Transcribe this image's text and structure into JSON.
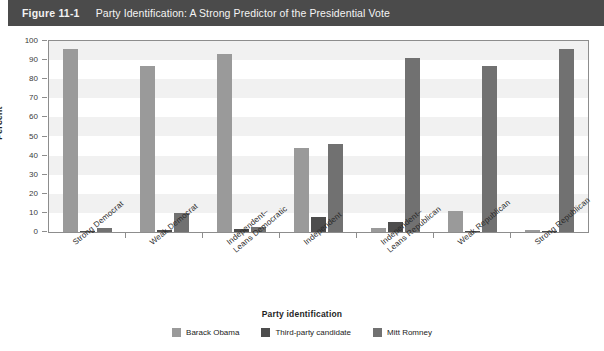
{
  "figure": {
    "number": "Figure 11-1",
    "title": "Party Identification: A Strong Predictor of the Presidential Vote"
  },
  "colors": {
    "title_band": "#4b4b4b",
    "obama": "#9a9a9a",
    "third_party": "#4d4d4d",
    "romney": "#717171",
    "axis": "#8d8d8d",
    "band": "#f1f1f1"
  },
  "chart_data": {
    "type": "bar",
    "title": "Party Identification: A Strong Predictor of the Presidential Vote",
    "xlabel": "Party identification",
    "ylabel": "Percent",
    "ylim": [
      0,
      100
    ],
    "yticks": [
      0,
      10,
      20,
      30,
      40,
      50,
      60,
      70,
      80,
      90,
      100
    ],
    "grid": false,
    "legend_position": "bottom",
    "categories": [
      "Strong Democrat",
      "Weak Democrat",
      "Independent–\nLeans Democratic",
      "Independent",
      "Independent–\nLeans Republican",
      "Weak Republican",
      "Strong Republican"
    ],
    "series": [
      {
        "name": "Barack Obama",
        "color": "#9a9a9a",
        "values": [
          96,
          87,
          93,
          44,
          2,
          11,
          1
        ]
      },
      {
        "name": "Third-party candidate",
        "color": "#4d4d4d",
        "values": [
          0.5,
          1,
          1.5,
          8,
          5,
          0.5,
          0.5
        ]
      },
      {
        "name": "Mitt Romney",
        "color": "#717171",
        "values": [
          2,
          10,
          2.5,
          46,
          91,
          87,
          96
        ]
      }
    ]
  }
}
